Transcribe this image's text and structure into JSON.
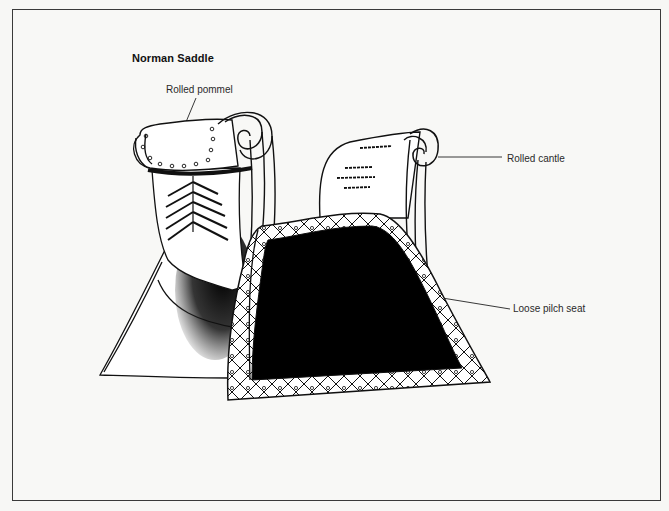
{
  "figure": {
    "title": "Norman Saddle",
    "labels": {
      "pommel": "Rolled pommel",
      "cantle": "Rolled cantle",
      "seat": "Loose pilch seat"
    }
  },
  "colors": {
    "ink": "#111111",
    "paper": "#f8f8f6",
    "frame": "#3a3a3a"
  }
}
